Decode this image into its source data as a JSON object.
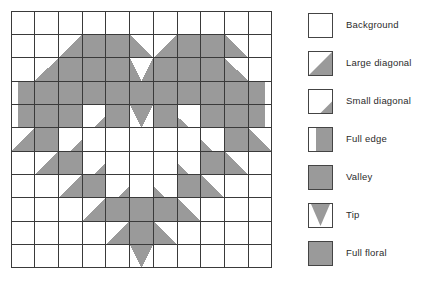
{
  "figure": {
    "title": "",
    "grid": {
      "rows": 11,
      "cols": 11,
      "cell_px": 23.7,
      "line_color": "#3a3a3a",
      "fill_color": "#9a9a9a",
      "background_color": "#ffffff"
    }
  },
  "chart_data": {
    "type": "heatmap",
    "title": "",
    "xlabel": "",
    "ylabel": "",
    "rows": 11,
    "cols": 11,
    "pattern_key": {
      "bg": "Background",
      "ld_tr": "Large diagonal (gray upper-right)",
      "ld_tl": "Large diagonal (gray upper-left)",
      "ld_br": "Large diagonal (gray lower-right)",
      "ld_bl": "Large diagonal (gray lower-left)",
      "sd_br": "Small diagonal (gray lower-right)",
      "sd_bl": "Small diagonal (gray lower-left)",
      "fe_r": "Full edge (gray right)",
      "fe_l": "Full edge (gray left)",
      "valley": "Valley",
      "tip": "Tip",
      "full": "Full floral"
    },
    "cells": [
      [
        "bg",
        "bg",
        "bg",
        "bg",
        "bg",
        "bg",
        "bg",
        "bg",
        "bg",
        "bg",
        "bg"
      ],
      [
        "bg",
        "bg",
        "ld_tr",
        "full",
        "full",
        "ld_tl",
        "ld_tr",
        "full",
        "full",
        "ld_tl",
        "bg"
      ],
      [
        "bg",
        "ld_tr",
        "full",
        "full",
        "full",
        "valley",
        "full",
        "full",
        "full",
        "ld_tl",
        "bg"
      ],
      [
        "fe_r",
        "full",
        "full",
        "full",
        "full",
        "full",
        "full",
        "full",
        "full",
        "full",
        "fe_l"
      ],
      [
        "fe_r",
        "full",
        "full",
        "sd_br",
        "full",
        "tip",
        "full",
        "sd_bl",
        "full",
        "full",
        "fe_l"
      ],
      [
        "ld_br",
        "full",
        "sd_br",
        "bg",
        "bg",
        "bg",
        "bg",
        "bg",
        "sd_bl",
        "full",
        "ld_bl"
      ],
      [
        "bg",
        "ld_br",
        "full",
        "sd_br",
        "bg",
        "bg",
        "bg",
        "sd_bl",
        "full",
        "ld_bl",
        "bg"
      ],
      [
        "bg",
        "bg",
        "ld_br",
        "full",
        "sd_br",
        "bg",
        "sd_bl",
        "full",
        "ld_bl",
        "bg",
        "bg"
      ],
      [
        "bg",
        "bg",
        "bg",
        "ld_br",
        "full",
        "full",
        "full",
        "ld_bl",
        "bg",
        "bg",
        "bg"
      ],
      [
        "bg",
        "bg",
        "bg",
        "bg",
        "ld_br",
        "full",
        "ld_bl",
        "bg",
        "bg",
        "bg",
        "bg"
      ],
      [
        "bg",
        "bg",
        "bg",
        "bg",
        "bg",
        "tip",
        "bg",
        "bg",
        "bg",
        "bg",
        "bg"
      ]
    ]
  },
  "legend": {
    "items": [
      {
        "label": "Background",
        "swatch": "bg"
      },
      {
        "label": "Large diagonal",
        "swatch": "large-diagonal"
      },
      {
        "label": "Small diagonal",
        "swatch": "small-diagonal"
      },
      {
        "label": "Full edge",
        "swatch": "full-edge"
      },
      {
        "label": "Valley",
        "swatch": "valley"
      },
      {
        "label": "Tip",
        "swatch": "tip"
      },
      {
        "label": "Full floral",
        "swatch": "full-floral"
      }
    ]
  }
}
